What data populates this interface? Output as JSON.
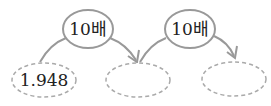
{
  "steps": [
    {
      "label": "10배"
    },
    {
      "label": "10배"
    }
  ],
  "boxes": [
    {
      "value": "1.948"
    },
    {
      "value": ""
    },
    {
      "value": ""
    }
  ],
  "colors": {
    "stroke": "#999999",
    "dashed": "#aaaaaa",
    "text": "#222222"
  }
}
